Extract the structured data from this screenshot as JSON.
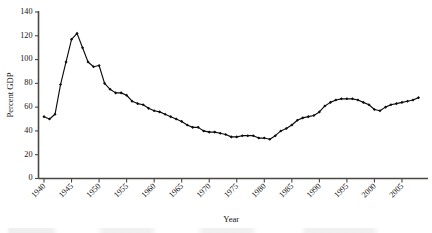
{
  "chart_data": {
    "type": "line",
    "title": "",
    "xlabel": "Year",
    "ylabel": "Percent GDP",
    "xlim": [
      1939,
      2009
    ],
    "ylim": [
      0,
      140
    ],
    "grid": false,
    "legend": "none",
    "marker": "filled-diamond",
    "line_color": "#0d0d0d",
    "axis_color": "#4a4744",
    "yticks": [
      0,
      20,
      40,
      60,
      80,
      100,
      120,
      140
    ],
    "ytick_labels": [
      "0",
      "20",
      "40",
      "60",
      "80",
      "100",
      "120",
      "140"
    ],
    "xticks": [
      1940,
      1945,
      1950,
      1955,
      1960,
      1965,
      1970,
      1975,
      1980,
      1985,
      1990,
      1995,
      2000,
      2005
    ],
    "xtick_labels": [
      "1940",
      "1945",
      "1950",
      "1955",
      "1960",
      "1965",
      "1970",
      "1975",
      "1980",
      "1985",
      "1990",
      "1995",
      "2000",
      "2005"
    ],
    "x": [
      1940,
      1941,
      1942,
      1943,
      1944,
      1945,
      1946,
      1947,
      1948,
      1949,
      1950,
      1951,
      1952,
      1953,
      1954,
      1955,
      1956,
      1957,
      1958,
      1959,
      1960,
      1961,
      1962,
      1963,
      1964,
      1965,
      1966,
      1967,
      1968,
      1969,
      1970,
      1971,
      1972,
      1973,
      1974,
      1975,
      1976,
      1977,
      1978,
      1979,
      1980,
      1981,
      1982,
      1983,
      1984,
      1985,
      1986,
      1987,
      1988,
      1989,
      1990,
      1991,
      1992,
      1993,
      1994,
      1995,
      1996,
      1997,
      1998,
      1999,
      2000,
      2001,
      2002,
      2003,
      2004,
      2005,
      2006,
      2007,
      2008
    ],
    "values": [
      52,
      50,
      54,
      79,
      98,
      117,
      122,
      110,
      98,
      94,
      95,
      80,
      75,
      72,
      72,
      70,
      65,
      63,
      62,
      59,
      57,
      56,
      54,
      52,
      50,
      48,
      45,
      43,
      43,
      40,
      39,
      39,
      38,
      37,
      35,
      35,
      36,
      36,
      36,
      34,
      34,
      33,
      36,
      40,
      42,
      45,
      49,
      51,
      52,
      53,
      56,
      61,
      64,
      66,
      67,
      67,
      67,
      66,
      64,
      62,
      58,
      57,
      60,
      62,
      63,
      64,
      65,
      66,
      68
    ],
    "units": "percent of GDP"
  },
  "axes": {
    "y_axis_title": "Percent GDP",
    "x_axis_title": "Year"
  }
}
